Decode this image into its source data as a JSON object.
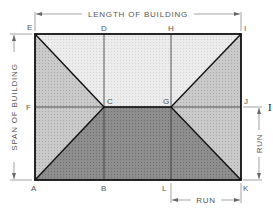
{
  "diagram": {
    "dimensions": {
      "length_label": "LENGTH OF BUILDING",
      "span_label": "SPAN OF BUILDING",
      "run_vertical_label": "RUN",
      "run_horizontal_label": "RUN"
    },
    "points": {
      "A": "A",
      "B": "B",
      "C": "C",
      "D": "D",
      "E": "E",
      "F": "F",
      "G": "G",
      "H": "H",
      "I": "I",
      "J": "J",
      "K": "K",
      "L": "L"
    },
    "stray_mark": "I",
    "colors": {
      "ridge_area": "#e6e6e6",
      "end_triangles": "#c4c4c4",
      "front_trapezoid": "#8a8a8a",
      "outline": "#111111",
      "text": "#555555"
    }
  }
}
